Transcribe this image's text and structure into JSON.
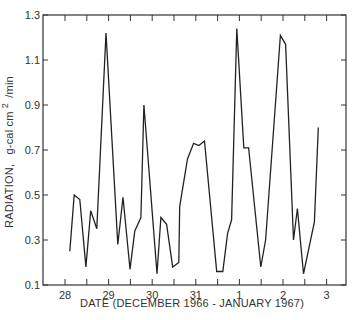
{
  "chart_data": {
    "type": "line",
    "title": "",
    "xlabel": "DATE (DECEMBER 1966 - JANUARY 1967)",
    "ylabel_main": "RADIATION,",
    "ylabel_units": "g-cal cm",
    "ylabel_sup": "2",
    "ylabel_tail": "/min",
    "ylim": [
      0.1,
      1.3
    ],
    "xlim": [
      -0.5,
      6.45
    ],
    "y_ticks": [
      0.1,
      0.3,
      0.5,
      0.7,
      0.9,
      1.1,
      1.3
    ],
    "y_tick_labels": [
      "0.1",
      "0.3",
      "0.5",
      "0.7",
      "0.9",
      "1.1",
      "1.3"
    ],
    "x_ticks": [
      0,
      1,
      2,
      3,
      4,
      5,
      6
    ],
    "x_tick_labels": [
      "28",
      "29",
      "30",
      "31",
      "1",
      "2",
      "3"
    ],
    "x_minor_ticks": [
      0.5,
      1.5,
      2.5,
      3.5,
      4.5,
      5.5
    ],
    "grid": false,
    "legend": null,
    "line_color": "#222222",
    "series": [
      {
        "name": "Radiation",
        "x": [
          0.11,
          0.21,
          0.34,
          0.48,
          0.59,
          0.73,
          0.94,
          1.21,
          1.33,
          1.49,
          1.6,
          1.74,
          1.81,
          2.11,
          2.2,
          2.33,
          2.47,
          2.61,
          2.63,
          2.81,
          2.95,
          3.07,
          3.2,
          3.48,
          3.62,
          3.73,
          3.82,
          3.94,
          4.1,
          4.21,
          4.49,
          4.6,
          4.94,
          5.06,
          5.24,
          5.33,
          5.47,
          5.72,
          5.81
        ],
        "values": [
          0.25,
          0.5,
          0.48,
          0.18,
          0.43,
          0.35,
          1.22,
          0.28,
          0.49,
          0.17,
          0.34,
          0.4,
          0.9,
          0.15,
          0.4,
          0.37,
          0.18,
          0.2,
          0.45,
          0.66,
          0.73,
          0.72,
          0.74,
          0.16,
          0.16,
          0.33,
          0.39,
          1.24,
          0.71,
          0.71,
          0.18,
          0.3,
          1.21,
          1.17,
          0.3,
          0.44,
          0.15,
          0.38,
          0.8
        ]
      }
    ]
  }
}
